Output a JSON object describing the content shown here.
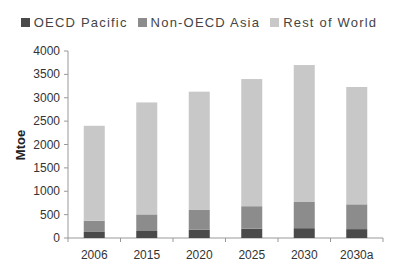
{
  "chart_data": {
    "type": "bar",
    "stacked": true,
    "title": "",
    "xlabel": "",
    "ylabel": "Mtoe",
    "ylim": [
      0,
      4000
    ],
    "yticks": [
      0,
      500,
      1000,
      1500,
      2000,
      2500,
      3000,
      3500,
      4000
    ],
    "grid": false,
    "legend_position": "top-center",
    "categories": [
      "2006",
      "2015",
      "2020",
      "2025",
      "2030",
      "2030a"
    ],
    "series": [
      {
        "name": "OECD Pacific",
        "color": "#4a4a4a",
        "values": [
          130,
          150,
          180,
          200,
          210,
          190
        ]
      },
      {
        "name": "Non-OECD Asia",
        "color": "#8c8c8c",
        "values": [
          240,
          355,
          420,
          480,
          560,
          530
        ]
      },
      {
        "name": "Rest of World",
        "color": "#c8c8c8",
        "values": [
          2030,
          2395,
          2530,
          2720,
          2930,
          2510
        ]
      }
    ]
  }
}
